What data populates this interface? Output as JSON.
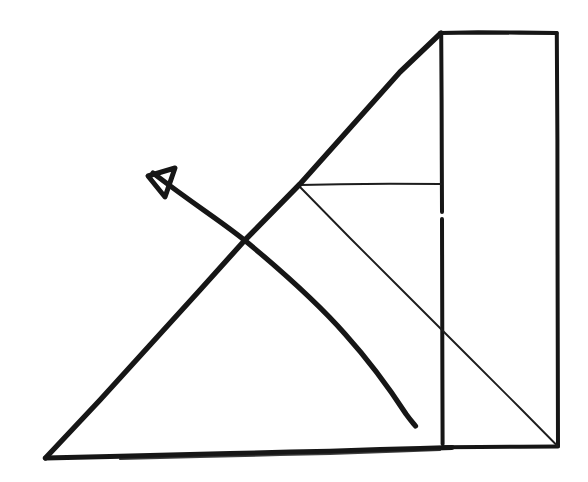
{
  "document": {
    "kind": "hand-drawn-sketch",
    "title": "Supply and demand style hand sketch",
    "background_color": "#ffffff",
    "ink_color": "#161616",
    "width": 588,
    "height": 482
  },
  "style": {
    "thick_stroke_width": 5.2,
    "medium_stroke_width": 4.0,
    "thin_stroke_width": 1.8,
    "hairline_stroke_width": 1.6,
    "ink_color": "#161616",
    "ink_color_soft": "#1d1d1d"
  },
  "shapes": {
    "baseline": {
      "name": "thick-horizontal-baseline",
      "description": "Heavy horizontal line forming the bottom of the big triangle",
      "points": "45,458 120,455 200,453 300,450 330,451 390,449 440,447 452,447",
      "stroke": "thick"
    },
    "hypotenuse": {
      "name": "thick-rising-diagonal",
      "description": "Heavy line rising from bottom-left vertex to the rectangle top-left corner",
      "points": "45,458 150,355 245,240 300,184 380,98 441,32",
      "stroke": "thick"
    },
    "rectangle": {
      "name": "tall-rectangle",
      "description": "Tall upright rectangle on the right side",
      "top_left": [
        441,
        32
      ],
      "top_right": [
        557,
        32
      ],
      "bottom_right": [
        558,
        447
      ],
      "bottom_left": [
        442,
        445
      ],
      "stroke": "medium",
      "left_edge_gap": {
        "from_y": 212,
        "to_y": 219
      }
    },
    "horizontal_connector": {
      "name": "thin-horizontal-connector",
      "description": "Thin horizontal line from the hypotenuse node across to the rectangle left edge",
      "from": [
        300,
        184
      ],
      "to": [
        441,
        184
      ],
      "stroke": "thin"
    },
    "falling_diagonal": {
      "name": "thin-falling-diagonal",
      "description": "Thin straight line falling from the node to the rectangle bottom-right corner",
      "from": [
        300,
        187
      ],
      "to": [
        558,
        447
      ],
      "stroke": "thin"
    },
    "curve": {
      "name": "thick-descending-curve",
      "description": "Heavy concave curve descending left to right, ending free above the baseline",
      "start": [
        152,
        172
      ],
      "end": [
        415,
        425
      ],
      "control_points": "152,172 245,240 310,290 365,352 400,398 415,425",
      "stroke": "thick"
    },
    "arrow_head": {
      "name": "open-triangle-arrowhead",
      "description": "Open triangular arrowhead at the upper-left end of the curve, pointing up-left",
      "tip": [
        148,
        176
      ],
      "wing_upper": [
        172,
        170
      ],
      "wing_lower": [
        166,
        196
      ],
      "stroke": "thick"
    }
  },
  "annotations": {
    "crossing_point": [
      245,
      240
    ],
    "node_point": [
      300,
      184
    ],
    "bottom_left_vertex": [
      45,
      458
    ],
    "curve_free_end": [
      415,
      425
    ]
  }
}
